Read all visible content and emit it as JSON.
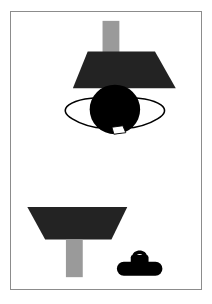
{
  "page": {
    "width": 212,
    "height": 304,
    "background_color": "#ffffff",
    "type": "illustration-figure"
  },
  "frame": {
    "border_color": "#8c8c8c",
    "fill_color": "#ffffff",
    "x": 10,
    "y": 11,
    "width": 192,
    "height": 279
  },
  "palette": {
    "dark": "#232323",
    "black": "#000000",
    "gray_bar": "#9a9a9a",
    "white": "#ffffff",
    "frame_line": "#8c8c8c",
    "caption_gray": "#c9c9c9"
  },
  "shapes": [
    {
      "id": "top-post",
      "name": "top-gray-post",
      "kind": "rectangle",
      "color": "#9a9a9a",
      "x": 103,
      "y": 20,
      "width": 17,
      "height": 34
    },
    {
      "id": "top-trapezoid",
      "name": "top-dark-trapezoid",
      "kind": "trapezoid",
      "color": "#232323",
      "top_left_x": 88,
      "top_right_x": 156,
      "bottom_left_x": 73,
      "bottom_right_x": 177,
      "top_y": 51,
      "bottom_y": 88
    },
    {
      "id": "center-disc",
      "name": "black-disc",
      "kind": "ellipse",
      "color": "#000000",
      "center_x": 121,
      "center_y": 110,
      "radius_x": 25,
      "radius_y": 25
    },
    {
      "id": "left-wing",
      "name": "left-outlined-wing",
      "kind": "outlined-curve",
      "fill": "#ffffff",
      "stroke": "#000000",
      "side": "left"
    },
    {
      "id": "right-wing",
      "name": "right-outlined-wing",
      "kind": "outlined-curve",
      "fill": "#ffffff",
      "stroke": "#000000",
      "side": "right"
    },
    {
      "id": "bottom-notch",
      "name": "white-notch",
      "kind": "quadrilateral",
      "color": "#ffffff",
      "center_x": 124,
      "center_y": 130
    },
    {
      "id": "bottom-trapezoid",
      "name": "bottom-dark-trapezoid",
      "kind": "trapezoid",
      "color": "#232323",
      "top_left_x": 27,
      "top_right_x": 128,
      "bottom_left_x": 45,
      "bottom_right_x": 112,
      "top_y": 208,
      "bottom_y": 241
    },
    {
      "id": "bottom-post",
      "name": "bottom-gray-post",
      "kind": "rectangle",
      "color": "#9a9a9a",
      "x": 66,
      "y": 241,
      "width": 17,
      "height": 38
    },
    {
      "id": "bag",
      "name": "black-bag-silhouette",
      "kind": "bag",
      "color": "#000000",
      "x": 118,
      "y": 246,
      "width": 44,
      "height": 26
    }
  ],
  "caption": {
    "text": "",
    "visible": false,
    "note": "illegible cut-off text fragments at bottom edge"
  }
}
